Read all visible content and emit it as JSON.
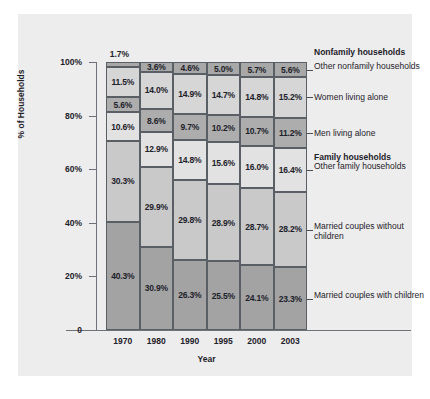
{
  "chart_data": {
    "type": "bar",
    "subtype": "stacked-100-percent",
    "title": "",
    "xlabel": "Year",
    "ylabel": "% of Households",
    "ylim": [
      0,
      100
    ],
    "ytick_labels": [
      "0",
      "20%",
      "40%",
      "60%",
      "80%",
      "100%"
    ],
    "ytick_values": [
      0,
      20,
      40,
      60,
      80,
      100
    ],
    "grid": false,
    "legend_position": "right-callouts",
    "categories": [
      "1970",
      "1980",
      "1990",
      "1995",
      "2000",
      "2003"
    ],
    "group_headers": [
      "Nonfamily households",
      "Family households"
    ],
    "series": [
      {
        "name": "Other nonfamily households",
        "group": "Nonfamily households",
        "color": "#a8a8a8",
        "values": [
          1.7,
          3.6,
          4.6,
          5.0,
          5.7,
          5.6
        ],
        "labels": [
          "1.7%",
          "3.6%",
          "4.6%",
          "5.0%",
          "5.7%",
          "5.6%"
        ]
      },
      {
        "name": "Women living alone",
        "group": "Nonfamily households",
        "color": "#d6d6d6",
        "values": [
          11.5,
          14.0,
          14.9,
          14.7,
          14.8,
          15.2
        ],
        "labels": [
          "11.5%",
          "14.0%",
          "14.9%",
          "14.7%",
          "14.8%",
          "15.2%"
        ]
      },
      {
        "name": "Men living alone",
        "group": "Nonfamily households",
        "color": "#adadad",
        "values": [
          5.6,
          8.6,
          9.7,
          10.2,
          10.7,
          11.2
        ],
        "labels": [
          "5.6%",
          "8.6%",
          "9.7%",
          "10.2%",
          "10.7%",
          "11.2%"
        ]
      },
      {
        "name": "Other family households",
        "group": "Family households",
        "color": "#e2e2e2",
        "values": [
          10.6,
          12.9,
          14.8,
          15.6,
          16.0,
          16.4
        ],
        "labels": [
          "10.6%",
          "12.9%",
          "14.8%",
          "15.6%",
          "16.0%",
          "16.4%"
        ]
      },
      {
        "name": "Married couples without children",
        "group": "Family households",
        "color": "#c9c9c9",
        "values": [
          30.3,
          29.9,
          29.8,
          28.9,
          28.7,
          28.2
        ],
        "labels": [
          "30.3%",
          "29.9%",
          "29.8%",
          "28.9%",
          "28.7%",
          "28.2%"
        ]
      },
      {
        "name": "Married couples with children",
        "group": "Family households",
        "color": "#a3a3a3",
        "values": [
          40.3,
          30.9,
          26.3,
          25.5,
          24.1,
          23.3
        ],
        "labels": [
          "40.3%",
          "30.9%",
          "26.3%",
          "25.5%",
          "24.1%",
          "23.3%"
        ]
      }
    ]
  },
  "axes": {
    "y_title": "% of Households",
    "x_title": "Year",
    "y_ticks": [
      {
        "label": "100%",
        "value": 100
      },
      {
        "label": "80%",
        "value": 80
      },
      {
        "label": "60%",
        "value": 60
      },
      {
        "label": "40%",
        "value": 40
      },
      {
        "label": "20%",
        "value": 20
      },
      {
        "label": "0",
        "value": 0
      }
    ],
    "x_ticks": [
      "1970",
      "1980",
      "1990",
      "1995",
      "2000",
      "2003"
    ]
  },
  "callouts": [
    {
      "kind": "group",
      "text": "Nonfamily households"
    },
    {
      "kind": "item",
      "text": "Other nonfamily households"
    },
    {
      "kind": "item",
      "text": "Women living alone"
    },
    {
      "kind": "item",
      "text": "Men living alone"
    },
    {
      "kind": "group",
      "text": "Family households"
    },
    {
      "kind": "item",
      "text": "Other family households"
    },
    {
      "kind": "item",
      "text": "Married couples without children"
    },
    {
      "kind": "item",
      "text": "Married couples with children"
    }
  ],
  "colors": {
    "panel_background": "#ededed",
    "axis_line": "#6d7278",
    "segment_border": "#5a5f66",
    "text": "#1d2129"
  }
}
